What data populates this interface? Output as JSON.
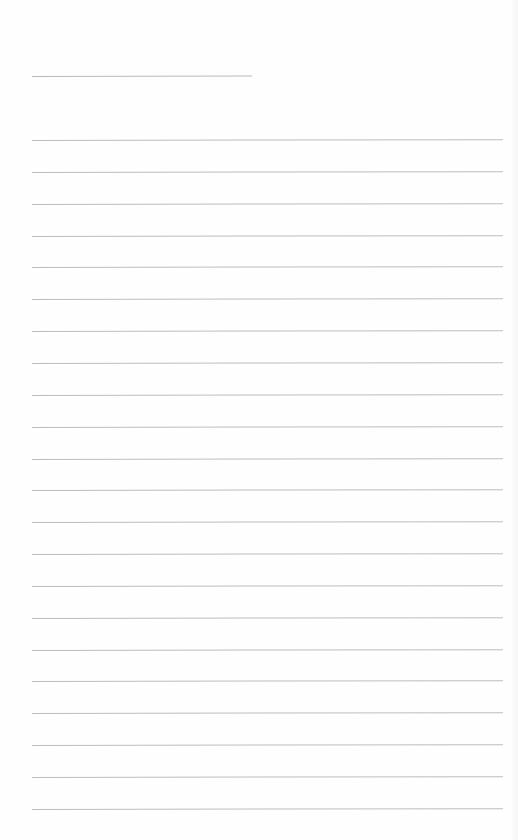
{
  "document": {
    "type": "blank lined paper",
    "title_line": {
      "text": "",
      "x": 32,
      "y": 76,
      "width": 220
    },
    "ruled_lines": {
      "count": 22,
      "x_start": 32,
      "x_end": 503,
      "first_y": 140,
      "spacing": 31.85,
      "line_color": "#bdbdbd",
      "entries": [
        "",
        "",
        "",
        "",
        "",
        "",
        "",
        "",
        "",
        "",
        "",
        "",
        "",
        "",
        "",
        "",
        "",
        "",
        "",
        "",
        "",
        ""
      ]
    },
    "colors": {
      "paper": "#fefefe",
      "line": "#bdbdbd"
    }
  }
}
